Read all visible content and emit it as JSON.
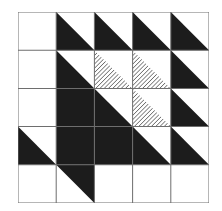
{
  "grid": {
    "rows": 5,
    "cols": 5
  },
  "colors": {
    "dark": "#1c1c1c",
    "line": "#6e6e6e",
    "light": "#ffffff",
    "hatch": "#555555"
  },
  "cells": [
    [
      "white",
      "dark-tri",
      "dark-tri",
      "dark-tri",
      "dark-tri"
    ],
    [
      "white",
      "dark-tri",
      "hatch-tri",
      "hatch-tri",
      "dark-tri"
    ],
    [
      "white",
      "dark-full",
      "dark-tri",
      "hatch-tri",
      "dark-tri"
    ],
    [
      "dark-tri",
      "dark-full",
      "dark-full",
      "dark-tri",
      "dark-tri"
    ],
    [
      "white",
      "dark-tri-ur",
      "white",
      "white",
      "white"
    ]
  ]
}
